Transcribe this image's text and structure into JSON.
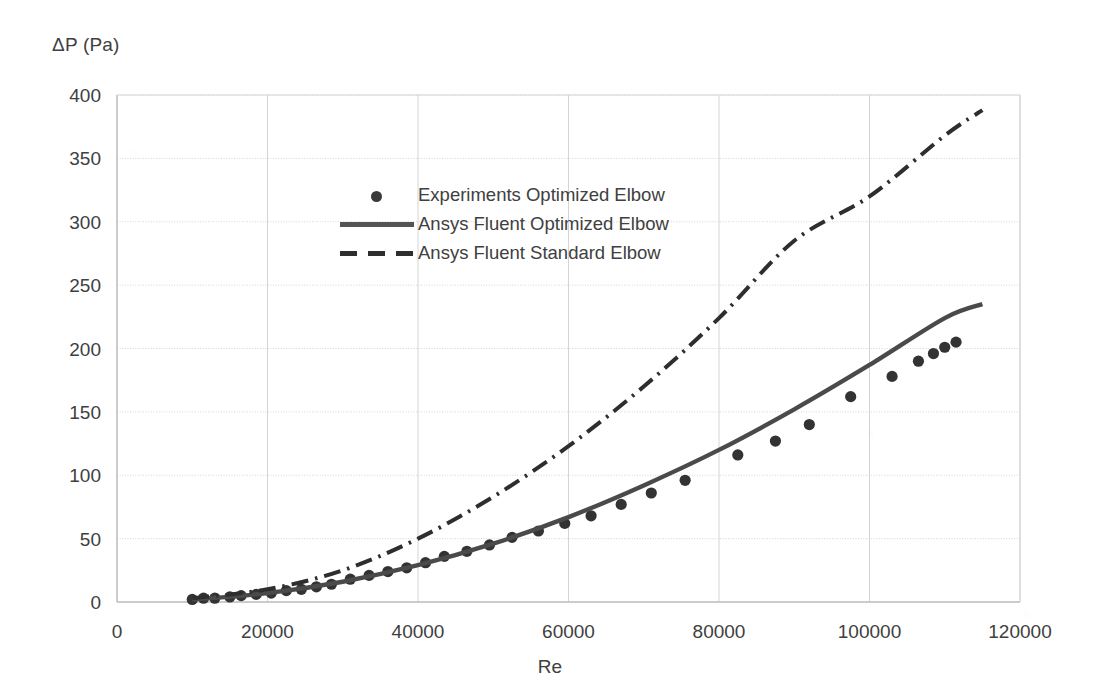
{
  "chart_data": {
    "type": "scatter",
    "title": "",
    "xlabel": "Re",
    "ylabel": "ΔP (Pa)",
    "xlim": [
      0,
      120000
    ],
    "ylim": [
      0,
      400
    ],
    "xticks": [
      0,
      20000,
      40000,
      60000,
      80000,
      100000,
      120000
    ],
    "yticks": [
      0,
      50,
      100,
      150,
      200,
      250,
      300,
      350,
      400
    ],
    "xtick_labels": [
      "0",
      "20000",
      "40000",
      "60000",
      "80000",
      "100000",
      "120000"
    ],
    "ytick_labels": [
      "0",
      "50",
      "100",
      "150",
      "200",
      "250",
      "300",
      "350",
      "400"
    ],
    "grid": true,
    "legend_position": "upper-left-inside",
    "series": [
      {
        "name": "Experiments Optimized Elbow",
        "style": "markers",
        "marker": "circle",
        "color": "#333333",
        "x": [
          10000,
          11500,
          13000,
          15000,
          16500,
          18500,
          20500,
          22500,
          24500,
          26500,
          28500,
          31000,
          33500,
          36000,
          38500,
          41000,
          43500,
          46500,
          49500,
          52500,
          56000,
          59500,
          63000,
          67000,
          71000,
          75500,
          82500,
          87500,
          92000,
          97500,
          103000,
          106500,
          108500,
          110000,
          111500
        ],
        "y": [
          2,
          3,
          3,
          4,
          5,
          6,
          7,
          9,
          10,
          12,
          14,
          18,
          21,
          24,
          27,
          31,
          36,
          40,
          45,
          51,
          56,
          62,
          68,
          77,
          86,
          96,
          116,
          127,
          140,
          162,
          178,
          190,
          196,
          201,
          205
        ]
      },
      {
        "name": "Ansys Fluent Optimized Elbow",
        "style": "solid-line",
        "color": "#4a4a4a",
        "x": [
          10000,
          20000,
          30000,
          40000,
          50000,
          60000,
          70000,
          80000,
          90000,
          100000,
          110000,
          115000
        ],
        "y": [
          2,
          7,
          16,
          29,
          46,
          67,
          92,
          120,
          152,
          187,
          224,
          235
        ]
      },
      {
        "name": "Ansys Fluent Standard Elbow",
        "style": "dash-dot-line",
        "color": "#2e2e2e",
        "x": [
          10000,
          20000,
          30000,
          40000,
          50000,
          60000,
          70000,
          80000,
          90000,
          100000,
          110000,
          115000
        ],
        "y": [
          3,
          10,
          25,
          50,
          83,
          123,
          170,
          224,
          285,
          320,
          368,
          388
        ]
      }
    ]
  },
  "axes": {
    "ylabel": "ΔP (Pa)",
    "xlabel": "Re"
  },
  "legend": {
    "items": [
      {
        "label": "Experiments Optimized Elbow",
        "marker": "dot-marker"
      },
      {
        "label": "Ansys Fluent Optimized Elbow",
        "marker": "solid-line-marker"
      },
      {
        "label": "Ansys Fluent Standard Elbow",
        "marker": "dashed-line-marker"
      }
    ]
  },
  "colors": {
    "grid": "#d4d4d4",
    "axis": "#bdbdbd",
    "marker": "#333333",
    "solid_line": "#4a4a4a",
    "dashed_line": "#2e2e2e",
    "text": "#404040"
  }
}
